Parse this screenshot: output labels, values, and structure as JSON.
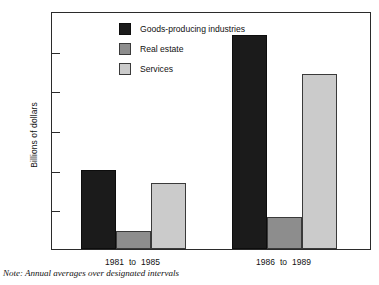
{
  "chart_data": {
    "type": "bar",
    "title": "",
    "xlabel": "",
    "ylabel": "Billions of dollars",
    "ylim": [
      0,
      30
    ],
    "yticks": [
      {
        "value": 30,
        "label": "$30"
      },
      {
        "value": 25,
        "label": "25"
      },
      {
        "value": 20,
        "label": "20"
      },
      {
        "value": 15,
        "label": "15"
      },
      {
        "value": 10,
        "label": "10"
      },
      {
        "value": 5,
        "label": "5"
      },
      {
        "value": 0,
        "label": "0"
      }
    ],
    "grid": false,
    "legend_position": "inside-top-left",
    "categories": [
      "1981 to 1985",
      "1986 to 1989"
    ],
    "category_parts": [
      {
        "start": "1981",
        "connector": "to",
        "end": "1985"
      },
      {
        "start": "1986",
        "connector": "to",
        "end": "1989"
      }
    ],
    "series": [
      {
        "name": "Goods-producing industries",
        "color": "#1b1b1b",
        "values": [
          10.0,
          27.0
        ]
      },
      {
        "name": "Real estate",
        "color": "#8d8d8d",
        "values": [
          2.3,
          4.0
        ]
      },
      {
        "name": "Services",
        "color": "#cbcbcb",
        "values": [
          8.3,
          22.0
        ]
      }
    ],
    "annotations": [
      "Note: Annual averages over designated intervals"
    ]
  },
  "legend": {
    "items": [
      {
        "label": "Goods-producing industries"
      },
      {
        "label": "Real estate"
      },
      {
        "label": "Services"
      }
    ]
  },
  "note": {
    "text": "Note: Annual averages over designated intervals"
  }
}
